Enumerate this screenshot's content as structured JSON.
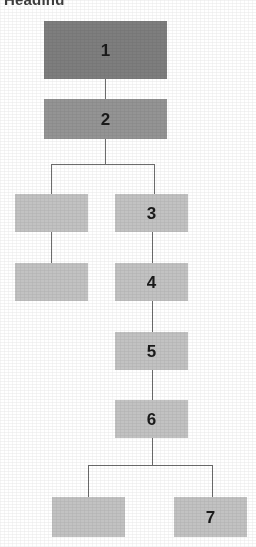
{
  "page": {
    "width": 256,
    "height": 547,
    "background": "#ffffff",
    "clipped_heading_text": "Heading"
  },
  "palette": {
    "node_dark": "#7e7e7e",
    "node_mid": "#949494",
    "node_light": "#c2c2c2",
    "edge": "#6d6d6d",
    "text": "#1a1a1a"
  },
  "diagram": {
    "type": "flowchart-tree",
    "orientation": "top-down",
    "node_count": 9,
    "labeled_node_count": 7,
    "unlabeled_node_count": 2,
    "branch_point_count": 2,
    "nodes": [
      {
        "id": "n1",
        "label": "1",
        "shade": "dark",
        "x": 44,
        "y": 21,
        "w": 123,
        "h": 58
      },
      {
        "id": "n2",
        "label": "2",
        "shade": "mid",
        "x": 44,
        "y": 99,
        "w": 123,
        "h": 40
      },
      {
        "id": "nL1",
        "label": "",
        "shade": "light",
        "x": 15,
        "y": 194,
        "w": 73,
        "h": 38
      },
      {
        "id": "n3",
        "label": "3",
        "shade": "light",
        "x": 115,
        "y": 194,
        "w": 73,
        "h": 38
      },
      {
        "id": "nL2",
        "label": "",
        "shade": "light",
        "x": 15,
        "y": 263,
        "w": 73,
        "h": 38
      },
      {
        "id": "n4",
        "label": "4",
        "shade": "light",
        "x": 115,
        "y": 263,
        "w": 73,
        "h": 38
      },
      {
        "id": "n5",
        "label": "5",
        "shade": "light",
        "x": 115,
        "y": 332,
        "w": 73,
        "h": 38
      },
      {
        "id": "n6",
        "label": "6",
        "shade": "light",
        "x": 115,
        "y": 400,
        "w": 73,
        "h": 38
      },
      {
        "id": "nL3",
        "label": "",
        "shade": "light",
        "x": 52,
        "y": 497,
        "w": 73,
        "h": 40
      },
      {
        "id": "n7",
        "label": "7",
        "shade": "light",
        "x": 174,
        "y": 497,
        "w": 73,
        "h": 40
      }
    ],
    "edges": [
      {
        "from": "n1",
        "to": "n2",
        "kind": "vertical"
      },
      {
        "from": "n2",
        "to": "nL1",
        "kind": "branch-left"
      },
      {
        "from": "n2",
        "to": "n3",
        "kind": "branch-right"
      },
      {
        "from": "nL1",
        "to": "nL2",
        "kind": "vertical"
      },
      {
        "from": "n3",
        "to": "n4",
        "kind": "vertical"
      },
      {
        "from": "n4",
        "to": "n5",
        "kind": "vertical"
      },
      {
        "from": "n5",
        "to": "n6",
        "kind": "vertical"
      },
      {
        "from": "n6",
        "to": "nL3",
        "kind": "branch-left"
      },
      {
        "from": "n6",
        "to": "n7",
        "kind": "branch-right"
      }
    ]
  }
}
